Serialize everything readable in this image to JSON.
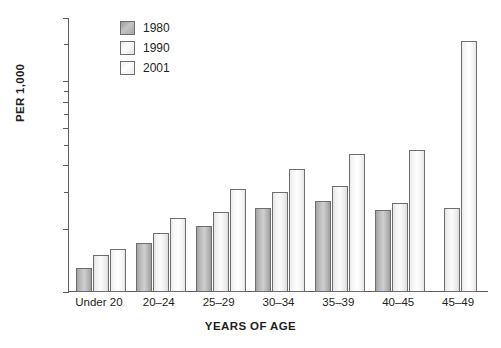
{
  "chart_data": {
    "type": "bar",
    "title": "",
    "subtitle": "",
    "xlabel": "YEARS OF AGE",
    "ylabel": "PER 1,000",
    "yscale": "log",
    "ylim": [
      10,
      200
    ],
    "grid": false,
    "legend_position": "top-left-inside",
    "categories": [
      "Under 20",
      "20–24",
      "25–29",
      "30–34",
      "35–39",
      "40–45",
      "45–49"
    ],
    "y_ticks_major": [
      10,
      20,
      40,
      60,
      80,
      100,
      200
    ],
    "y_tick_labels": [
      "10",
      "20",
      "40",
      "60",
      "80",
      "100",
      "200"
    ],
    "y_ticks_minor": [
      30,
      50,
      70,
      90
    ],
    "series": [
      {
        "name": "1980",
        "color": "#b4b4b4",
        "values": [
          13,
          17,
          20.5,
          25,
          27,
          24.5,
          null
        ]
      },
      {
        "name": "1990",
        "color": "#f2f2f2",
        "values": [
          15,
          19,
          24,
          30,
          32,
          26.5,
          25
        ]
      },
      {
        "name": "2001",
        "color": "#fafafa",
        "values": [
          16,
          22.5,
          31,
          38.5,
          45,
          47,
          155
        ]
      }
    ]
  },
  "legend": {
    "entries": [
      {
        "label": "1980",
        "swatch": "legend-swatch-1980"
      },
      {
        "label": "1990",
        "swatch": "legend-swatch-1990"
      },
      {
        "label": "2001",
        "swatch": "legend-swatch-2001"
      }
    ]
  },
  "axes": {
    "y_title": "PER 1,000",
    "x_title": "YEARS OF AGE"
  }
}
